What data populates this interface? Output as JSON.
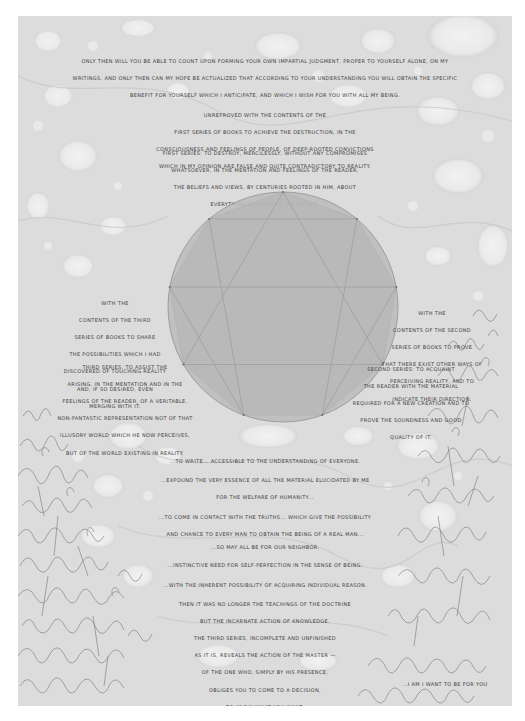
{
  "page": {
    "background_color": "#ffffff",
    "panel_color": "#dedede",
    "ink_color": "#3f3f3f"
  },
  "top_paragraph": {
    "lines": [
      "Only then will you be able to count upon forming your own impartial judgment, proper to yourself alone, on my",
      "writings. And only then can my hope be actualized that according to your understanding you will obtain the specific",
      "benefit for yourself which I anticipate, and which I wish for you with all my being."
    ]
  },
  "upper_center": {
    "intro_lines": [
      "Unreproved with the contents of the",
      "first series of books to achieve the destruction, in the",
      "consciousness and feelings of people, of deep-rooted convictions",
      "which in my opinion are false and quite contradictory to reality."
    ],
    "first_series_lines": [
      "First series: to destroy, mercilessly, without any compromises",
      "whatsoever, in the mentation and feelings of the reader,",
      "the beliefs and views, by centuries rooted in him, about",
      "everything existing in the world."
    ]
  },
  "left_block": {
    "intro_lines": [
      "With the",
      "contents of the third",
      "series of books to share",
      "the possibilities which I had",
      "discovered of touching reality",
      "and, if so desired, even",
      "merging with it."
    ],
    "third_series_lines": [
      "Third series: to assist the",
      "arising, in the mentation and in the",
      "feelings of the reader, of a veritable,",
      "non-fantastic representation not of that",
      "illusory world which he now perceives,",
      "but of the world existing in reality."
    ]
  },
  "right_block": {
    "intro_lines": [
      "With the",
      "contents of the second",
      "series of books to prove",
      "that there exist other ways of",
      "perceiving reality, and to",
      "indicate their direction."
    ],
    "second_series_lines": [
      "Second series: to acquaint",
      "the reader with the material",
      "required for a new creation and to",
      "prove the soundness and good",
      "quality of it."
    ]
  },
  "enneagram": {
    "points": 9,
    "circle_fill": "#bdbdbd",
    "stroke_color": "#8a8a8a"
  },
  "lower_statements": [
    {
      "lines": [
        "...to write... accessible to the understanding of everyone."
      ]
    },
    {
      "lines": [
        "...expound the very essence of all the material elucidated by me",
        "for the welfare of humanity..."
      ]
    },
    {
      "lines": [
        "...to come in contact with the truths... which give the possibility",
        "and chance to every man to obtain the Being of a real man..."
      ]
    },
    {
      "lines": [
        "...so may all be for our neighbor."
      ]
    },
    {
      "lines": [
        "...instinctive need for self-perfection in the sense of Being."
      ]
    },
    {
      "lines": [
        "...with the inherent possibility of acquiring individual Reason."
      ]
    }
  ],
  "closing_paragraph": {
    "lines": [
      "Then it was no longer the teachings of the doctrine",
      "but the incarnate action of knowledge.",
      "The Third Series, incomplete and unfinished",
      "as it is, reveals the action of the Master —",
      "of the one who, simply by his presence,",
      "obliges you to come to a decision,",
      "to know what you want."
    ]
  },
  "signature": {
    "text": "...I am I want to be for you"
  }
}
